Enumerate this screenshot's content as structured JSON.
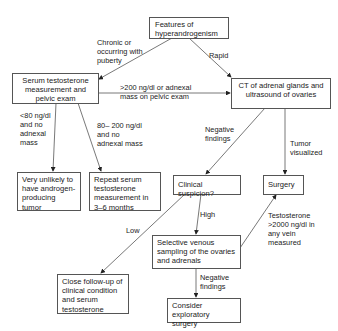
{
  "nodes": {
    "features": "Features of hyperandrogenism",
    "serum": "Serum testosterone measurement and pelvic exam",
    "ct": "CT of adrenal glands and ultrasound of ovaries",
    "unlikely": "Very unlikely to have androgen-producing tumor",
    "repeat": "Repeat serum testosterone measurement in 3–6 months",
    "clinical": "Clinical suspicion?",
    "surgery": "Surgery",
    "venous": "Selective venous sampling of the ovaries and adrenals",
    "followup": "Close follow-up of clinical condition and serum testosterone",
    "exploratory": "Consider exploratory surgery"
  },
  "edges": {
    "chronic": "Chronic or\noccurring with\npuberty",
    "rapid": "Rapid",
    "over200": ">200 ng/dl  or adnexal\nmass on pelvic exam",
    "under80": "<80 ng/dl\nand no\nadnexal\nmass",
    "range80_200": "80– 200 ng/dl\nand no\nadnexal mass",
    "negative1": "Negative\nfindings",
    "tumor": "Tumor\nvisualized",
    "low": "Low",
    "high": "High",
    "testo2000": "Testosterone\n>2000 ng/dl  in\nany vein\nmeasured",
    "negative2": "Negative\nfindings"
  }
}
